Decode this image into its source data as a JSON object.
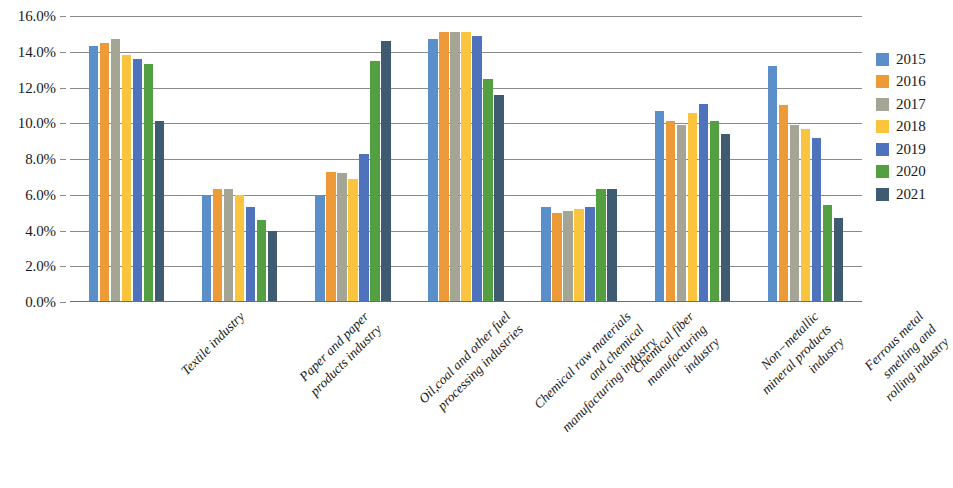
{
  "chart_data": {
    "type": "bar",
    "title": "",
    "subtitle": "",
    "xlabel": "",
    "ylabel": "",
    "ylim": [
      0,
      16
    ],
    "y_tick_labels": [
      "0.0%",
      "2.0%",
      "4.0%",
      "6.0%",
      "8.0%",
      "10.0%",
      "12.0%",
      "14.0%",
      "16.0%"
    ],
    "y_tick_values": [
      0,
      2,
      4,
      6,
      8,
      10,
      12,
      14,
      16
    ],
    "grid": "horizontal",
    "legend_position": "right",
    "value_unit": "percent",
    "categories": [
      "Textile industry",
      "Paper and paper products industry",
      "Oil, coal and other fuel processing industries",
      "Chemical raw materials and chemical manufacturing industry",
      "Chemical fiber manufacturing industry",
      "Non-metallic mineral products industry",
      "Ferrous metal smelting and rolling industry"
    ],
    "category_lines": [
      [
        "Textile industry"
      ],
      [
        "Paper and paper",
        "products industry"
      ],
      [
        "Oil,coal and other fuel",
        "processing industries"
      ],
      [
        "Chemical raw materials",
        "and chemical",
        "manufacturing industry"
      ],
      [
        "Chemical fiber",
        "manufacturing",
        "industry"
      ],
      [
        "Non−metallic",
        "mineral products",
        "industry"
      ],
      [
        "Ferrous metal",
        "smelting and",
        "rolling industry"
      ]
    ],
    "series": [
      {
        "name": "2015",
        "color": "#5b8fc9",
        "values": [
          14.3,
          6.0,
          6.0,
          14.7,
          5.3,
          10.7,
          13.2
        ]
      },
      {
        "name": "2016",
        "color": "#ed9b38",
        "values": [
          14.5,
          6.3,
          7.3,
          15.1,
          5.0,
          10.1,
          11.0
        ]
      },
      {
        "name": "2017",
        "color": "#a5a595",
        "values": [
          14.7,
          6.3,
          7.2,
          15.1,
          5.1,
          9.9,
          9.9
        ]
      },
      {
        "name": "2018",
        "color": "#fbc43f",
        "values": [
          13.8,
          6.0,
          6.9,
          15.1,
          5.2,
          10.6,
          9.7
        ]
      },
      {
        "name": "2019",
        "color": "#4f72bd",
        "values": [
          13.6,
          5.3,
          8.3,
          14.9,
          5.3,
          11.1,
          9.2
        ]
      },
      {
        "name": "2020",
        "color": "#५5a043",
        "values": [
          13.3,
          4.6,
          13.5,
          12.5,
          6.3,
          10.1,
          5.4
        ]
      },
      {
        "name": "2021",
        "color": "#3f5b72",
        "values": [
          10.1,
          4.0,
          14.6,
          11.6,
          6.3,
          9.4,
          4.7
        ]
      }
    ]
  },
  "legend": {
    "items": [
      {
        "label": "2015",
        "color": "#5b8fc9"
      },
      {
        "label": "2016",
        "color": "#ed9b38"
      },
      {
        "label": "2017",
        "color": "#a5a595"
      },
      {
        "label": "2018",
        "color": "#fbc43f"
      },
      {
        "label": "2019",
        "color": "#4f72bd"
      },
      {
        "label": "2020",
        "color": "#559f43"
      },
      {
        "label": "2021",
        "color": "#3f5b72"
      }
    ]
  }
}
